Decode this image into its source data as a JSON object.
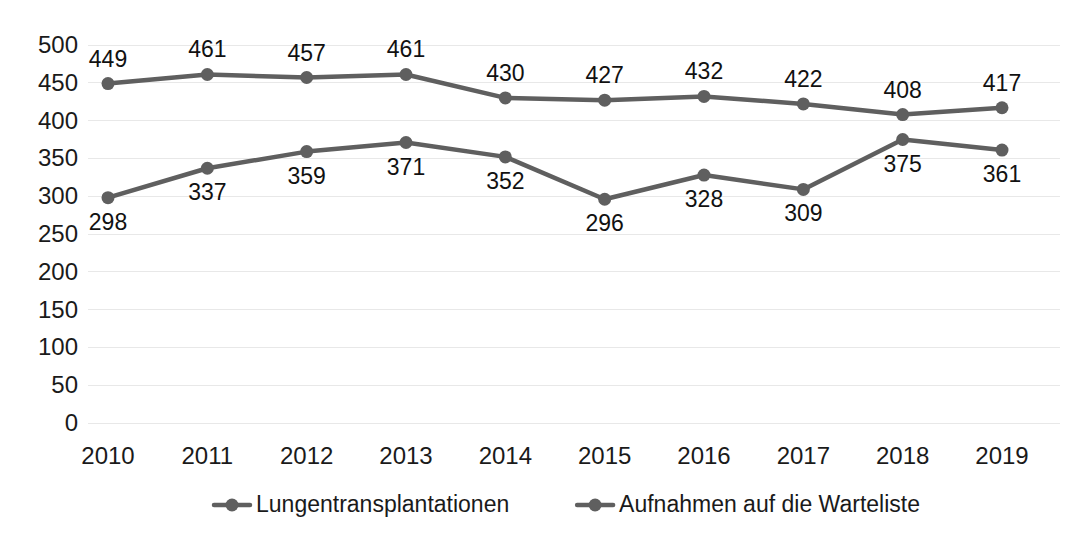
{
  "chart_data": {
    "type": "line",
    "title": "",
    "subtitle": "",
    "xlabel": "",
    "ylabel": "",
    "categories": [
      "2010",
      "2011",
      "2012",
      "2013",
      "2014",
      "2015",
      "2016",
      "2017",
      "2018",
      "2019"
    ],
    "series": [
      {
        "name": "Lungentransplantationen",
        "values": [
          449,
          461,
          457,
          461,
          430,
          427,
          432,
          422,
          408,
          417
        ],
        "color": "#5f5f5f",
        "label_positions": [
          "above",
          "above",
          "above",
          "above",
          "above",
          "above",
          "above",
          "above",
          "above",
          "above"
        ]
      },
      {
        "name": "Aufnahmen auf die Warteliste",
        "values": [
          298,
          337,
          359,
          371,
          352,
          296,
          328,
          309,
          375,
          361
        ],
        "color": "#5f5f5f",
        "label_positions": [
          "below",
          "below",
          "below",
          "below",
          "below",
          "below",
          "below",
          "below",
          "below",
          "below"
        ]
      }
    ],
    "ylim": [
      0,
      500
    ],
    "yticks": [
      0,
      50,
      100,
      150,
      200,
      250,
      300,
      350,
      400,
      450,
      500
    ],
    "ytick_labels": [
      "0",
      "50",
      "100",
      "150",
      "200",
      "250",
      "300",
      "350",
      "400",
      "450",
      "500"
    ],
    "grid": true,
    "grid_axis": "y",
    "legend_position": "bottom",
    "marker": "circle",
    "background": "#ffffff",
    "grid_color": "#e8e8e8"
  },
  "legend": {
    "entries": [
      {
        "label": "Lungentransplantationen",
        "marker": "line-dot-marker"
      },
      {
        "label": "Aufnahmen auf die Warteliste",
        "marker": "line-dot-marker"
      }
    ]
  }
}
